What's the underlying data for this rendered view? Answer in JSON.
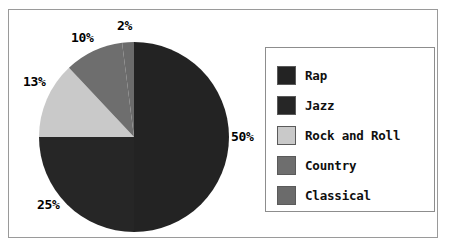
{
  "chart_data": {
    "type": "pie",
    "title": "",
    "categories": [
      "Rap",
      "Jazz",
      "Rock and Roll",
      "Country",
      "Classical"
    ],
    "values": [
      50,
      25,
      13,
      10,
      2
    ],
    "value_labels": [
      "50%",
      "25%",
      "13%",
      "10%",
      "2%"
    ],
    "colors": [
      "#232323",
      "#262626",
      "#c9c9c9",
      "#6e6e6e",
      "#6b6b6b"
    ],
    "legend_position": "right",
    "start_angle_deg": 0,
    "direction": "clockwise",
    "grid": false,
    "slices": [
      {
        "label": "Rap",
        "value": 50,
        "value_label": "50%",
        "color": "#232323"
      },
      {
        "label": "Jazz",
        "value": 25,
        "value_label": "25%",
        "color": "#262626"
      },
      {
        "label": "Rock and Roll",
        "value": 13,
        "value_label": "13%",
        "color": "#c9c9c9"
      },
      {
        "label": "Country",
        "value": 10,
        "value_label": "10%",
        "color": "#6e6e6e"
      },
      {
        "label": "Classical",
        "value": 2,
        "value_label": "2%",
        "color": "#6b6b6b"
      }
    ]
  },
  "legend": {
    "items": [
      {
        "label": "Rap"
      },
      {
        "label": "Jazz"
      },
      {
        "label": "Rock and Roll"
      },
      {
        "label": "Country"
      },
      {
        "label": "Classical"
      }
    ]
  }
}
